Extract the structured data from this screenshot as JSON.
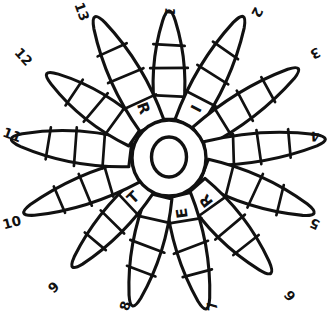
{
  "diagram": {
    "type": "radial-petal-diagram",
    "petal_count": 13,
    "center": {
      "letter": "O",
      "shape": "donut-ring"
    },
    "segments_per_petal": 4,
    "stroke_color": "#111111",
    "fill_color": "#ffffff",
    "background_color": "#ffffff",
    "petals": [
      {
        "index": 1,
        "number_label": "1",
        "letter": "",
        "angle_deg": 0,
        "label_rotation_deg": 95
      },
      {
        "index": 2,
        "number_label": "2",
        "letter": "I",
        "angle_deg": 27.7,
        "label_rotation_deg": 118
      },
      {
        "index": 3,
        "number_label": "3",
        "letter": "",
        "angle_deg": 55.4,
        "label_rotation_deg": 152
      },
      {
        "index": 4,
        "number_label": "4",
        "letter": "",
        "angle_deg": 83.1,
        "label_rotation_deg": 178
      },
      {
        "index": 5,
        "number_label": "5",
        "letter": "",
        "angle_deg": 110.8,
        "label_rotation_deg": 204
      },
      {
        "index": 6,
        "number_label": "6",
        "letter": "R",
        "angle_deg": 138.5,
        "label_rotation_deg": 232
      },
      {
        "index": 7,
        "number_label": "7",
        "letter": "E",
        "angle_deg": 166.2,
        "label_rotation_deg": 262
      },
      {
        "index": 8,
        "number_label": "8",
        "letter": "",
        "angle_deg": 193.8,
        "label_rotation_deg": 288
      },
      {
        "index": 9,
        "number_label": "9",
        "letter": "T",
        "angle_deg": 221.5,
        "label_rotation_deg": 316
      },
      {
        "index": 10,
        "number_label": "10",
        "letter": "",
        "angle_deg": 249.2,
        "label_rotation_deg": 345
      },
      {
        "index": 11,
        "number_label": "11",
        "letter": "",
        "angle_deg": 276.9,
        "label_rotation_deg": 20
      },
      {
        "index": 12,
        "number_label": "12",
        "letter": "",
        "angle_deg": 304.6,
        "label_rotation_deg": 48
      },
      {
        "index": 13,
        "number_label": "13",
        "letter": "R",
        "angle_deg": 332.3,
        "label_rotation_deg": 70
      }
    ],
    "letters_sequence": [
      "R",
      "I",
      "R",
      "E",
      "T",
      "O"
    ]
  }
}
